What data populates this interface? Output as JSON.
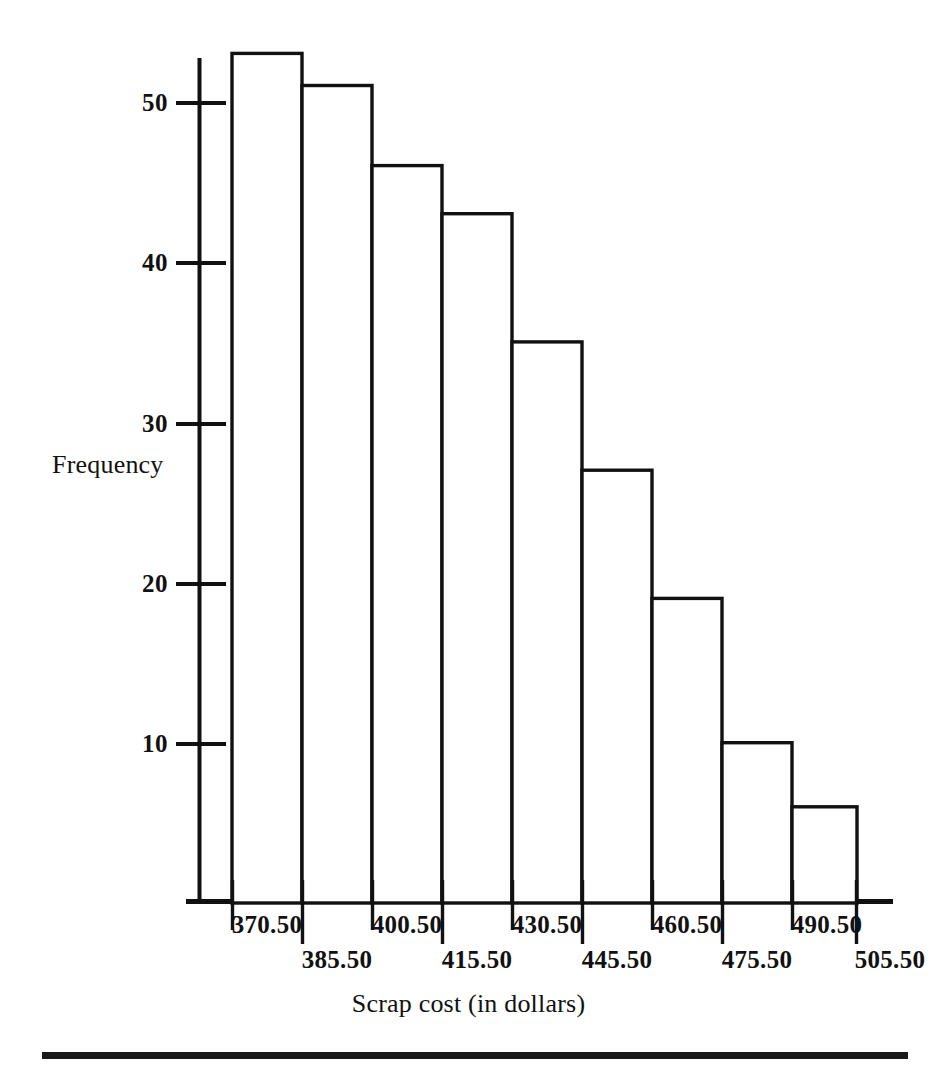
{
  "chart_data": {
    "type": "bar",
    "title": "",
    "subtitle": "",
    "xlabel": "Scrap cost (in dollars)",
    "ylabel": "Frequency",
    "categories": [
      "370.50",
      "385.50",
      "400.50",
      "415.50",
      "430.50",
      "445.50",
      "460.50",
      "475.50",
      "490.50"
    ],
    "bin_edges": [
      "370.50",
      "385.50",
      "400.50",
      "415.50",
      "430.50",
      "445.50",
      "460.50",
      "475.50",
      "490.50",
      "505.50"
    ],
    "values": [
      53,
      51,
      46,
      43,
      35,
      27,
      19,
      10,
      6
    ],
    "bars": [
      {
        "label": "370.50-385.50",
        "lower": "370.50",
        "upper": "385.50",
        "value": 53
      },
      {
        "label": "385.50-400.50",
        "lower": "385.50",
        "upper": "400.50",
        "value": 51
      },
      {
        "label": "400.50-415.50",
        "lower": "400.50",
        "upper": "415.50",
        "value": 46
      },
      {
        "label": "415.50-430.50",
        "lower": "415.50",
        "upper": "430.50",
        "value": 43
      },
      {
        "label": "430.50-445.50",
        "lower": "430.50",
        "upper": "445.50",
        "value": 35
      },
      {
        "label": "445.50-460.50",
        "lower": "445.50",
        "upper": "460.50",
        "value": 27
      },
      {
        "label": "460.50-475.50",
        "lower": "460.50",
        "upper": "475.50",
        "value": 19
      },
      {
        "label": "475.50-490.50",
        "lower": "475.50",
        "upper": "490.50",
        "value": 10
      },
      {
        "label": "490.50-505.50",
        "lower": "490.50",
        "upper": "505.50",
        "value": 6
      }
    ],
    "yticks": [
      10,
      20,
      30,
      40,
      50
    ],
    "ytick_labels": [
      "10",
      "20",
      "30",
      "40",
      "50"
    ],
    "ylim": [
      0,
      53
    ],
    "xtick_labels_upper_row": [
      "370.50",
      "400.50",
      "430.50",
      "460.50",
      "490.50"
    ],
    "xtick_labels_lower_row": [
      "385.50",
      "415.50",
      "445.50",
      "475.50",
      "505.50"
    ],
    "grid": false,
    "legend": null,
    "legend_position": "none",
    "bar_fill": "#ffffff",
    "bar_stroke": "#111111",
    "axis_color": "#111111",
    "background": "#ffffff"
  },
  "axes": {
    "y_title": "Frequency",
    "x_title": "Scrap cost (in dollars)",
    "ytick_0": "50",
    "ytick_1": "40",
    "ytick_2": "30",
    "ytick_3": "20",
    "ytick_4": "10"
  },
  "xlabels": {
    "t0": "370.50",
    "t1": "385.50",
    "t2": "400.50",
    "t3": "415.50",
    "t4": "430.50",
    "t5": "445.50",
    "t6": "460.50",
    "t7": "475.50",
    "t8": "490.50",
    "t9": "505.50"
  }
}
